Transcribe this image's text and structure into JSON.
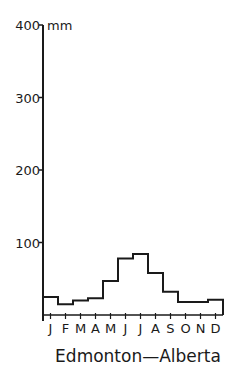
{
  "chart_data": {
    "type": "bar",
    "style": "step-histogram",
    "title": "Edmonton—Alberta",
    "ylabel": "mm",
    "xlabel": "",
    "categories": [
      "J",
      "F",
      "M",
      "A",
      "M",
      "J",
      "J",
      "A",
      "S",
      "O",
      "N",
      "D"
    ],
    "values": [
      25,
      15,
      20,
      23,
      47,
      78,
      84,
      58,
      32,
      18,
      18,
      21
    ],
    "ylim": [
      0,
      400
    ],
    "yticks": [
      100,
      200,
      300,
      400
    ],
    "grid": false,
    "legend": null
  },
  "axis": {
    "unit": "mm",
    "tick_labels": [
      "100",
      "200",
      "300",
      "400"
    ]
  },
  "colors": {
    "ink": "#1a1a1a",
    "background": "#ffffff"
  }
}
